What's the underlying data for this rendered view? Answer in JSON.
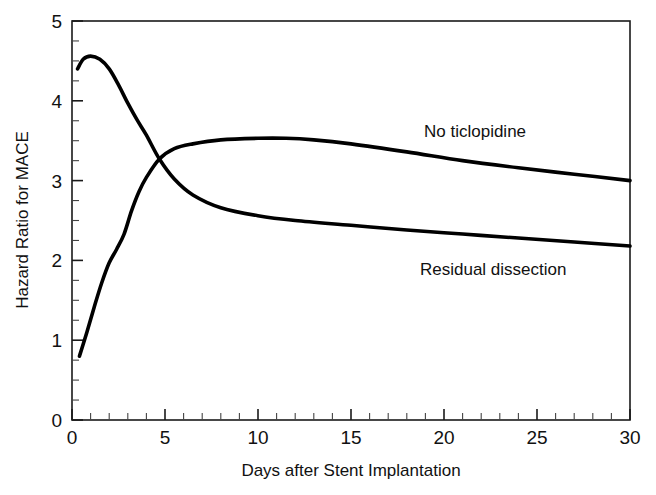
{
  "chart_data": {
    "type": "line",
    "title": "",
    "xlabel": "Days after Stent Implantation",
    "ylabel": "Hazard Ratio for MACE",
    "xlim": [
      0,
      30
    ],
    "ylim": [
      0,
      5
    ],
    "x_ticks": [
      0,
      5,
      10,
      15,
      20,
      25,
      30
    ],
    "y_ticks": [
      0,
      1,
      2,
      3,
      4,
      5
    ],
    "x_tick_labels": [
      "0",
      "5",
      "10",
      "15",
      "20",
      "25",
      "30"
    ],
    "y_tick_labels": [
      "0",
      "1",
      "2",
      "3",
      "4",
      "5"
    ],
    "x_minor_step": 1,
    "y_minor_step": 0.25,
    "grid": false,
    "legend": "inline-annotations",
    "series": [
      {
        "name": "No ticlopidine",
        "label_position": "upper-right",
        "color": "#000000",
        "x": [
          0.3,
          0.6,
          1.0,
          1.5,
          2.0,
          2.5,
          3.0,
          3.5,
          4.0,
          4.7,
          5.5,
          6.5,
          8.0,
          10.0,
          12.0,
          15.0,
          18.0,
          21.0,
          24.0,
          27.0,
          30.0
        ],
        "y": [
          4.4,
          4.52,
          4.56,
          4.52,
          4.4,
          4.2,
          3.97,
          3.76,
          3.57,
          3.27,
          3.02,
          2.82,
          2.66,
          2.56,
          2.5,
          2.44,
          2.38,
          2.33,
          2.28,
          2.23,
          2.18
        ]
      },
      {
        "name": "Residual dissection",
        "label_position": "lower-right",
        "color": "#000000",
        "x": [
          0.4,
          0.8,
          1.2,
          1.6,
          2.0,
          2.4,
          2.8,
          3.2,
          3.6,
          4.0,
          4.7,
          5.5,
          6.5,
          8.0,
          10.0,
          11.5,
          13.0,
          15.0,
          18.0,
          21.0,
          24.0,
          27.0,
          30.0
        ],
        "y": [
          0.8,
          1.1,
          1.42,
          1.72,
          1.97,
          2.14,
          2.33,
          2.62,
          2.86,
          3.04,
          3.27,
          3.4,
          3.46,
          3.51,
          3.53,
          3.53,
          3.51,
          3.46,
          3.36,
          3.25,
          3.16,
          3.08,
          3.0
        ]
      }
    ],
    "annotations": [
      {
        "text": "No ticlopidine",
        "x_px": 424,
        "y_px": 137
      },
      {
        "text": "Residual dissection",
        "x_px": 420,
        "y_px": 275
      }
    ]
  },
  "axes": {
    "ylabel": "Hazard Ratio for MACE",
    "xlabel": "Days after Stent Implantation",
    "y_labels": [
      "5",
      "4",
      "3",
      "2",
      "1",
      "0"
    ],
    "x_labels": [
      "0",
      "5",
      "10",
      "15",
      "20",
      "25",
      "30"
    ]
  },
  "labels": {
    "series_upper": "No ticlopidine",
    "series_lower": "Residual dissection"
  },
  "colors": {
    "curve": "#000000",
    "axis": "#1a1a1a",
    "background": "#ffffff"
  }
}
